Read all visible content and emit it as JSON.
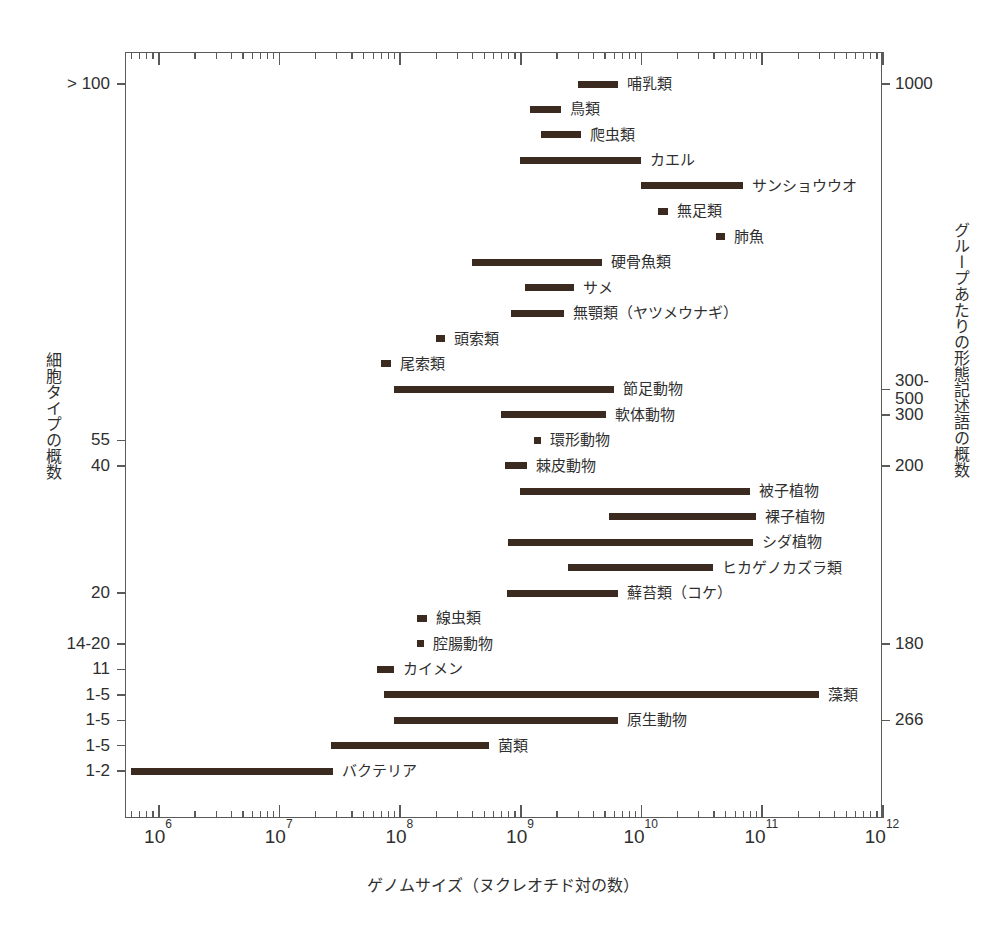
{
  "chart_data": {
    "type": "bar",
    "orientation": "horizontal-range",
    "title": "",
    "xlabel": "ゲノムサイズ（ヌクレオチド対の数）",
    "ylabel_left": "細胞タイプの概数",
    "ylabel_right": "グループあたりの形態記述語の概数",
    "xscale": "log",
    "xlim": [
      1000000,
      1000000000000
    ],
    "xticks": [
      "10⁶",
      "10⁷",
      "10⁸",
      "10⁹",
      "10¹⁰",
      "10¹¹",
      "10¹²"
    ],
    "xtick_exponents": [
      6,
      7,
      8,
      9,
      10,
      11,
      12
    ],
    "grid": false,
    "legend": "none",
    "bars": [
      {
        "label": "哺乳類",
        "x_start": 3000000000.0,
        "x_end": 6500000000.0,
        "row": 0
      },
      {
        "label": "鳥類",
        "x_start": 1200000000.0,
        "x_end": 2200000000.0,
        "row": 1
      },
      {
        "label": "爬虫類",
        "x_start": 1500000000.0,
        "x_end": 3200000000.0,
        "row": 2
      },
      {
        "label": "カエル",
        "x_start": 1000000000.0,
        "x_end": 10000000000.0,
        "row": 3
      },
      {
        "label": "サンショウウオ",
        "x_start": 10000000000.0,
        "x_end": 70000000000.0,
        "row": 4
      },
      {
        "label": "無足類",
        "x_start": 14000000000.0,
        "x_end": 17000000000.0,
        "row": 5
      },
      {
        "label": "肺魚",
        "x_start": 42000000000.0,
        "x_end": 50000000000.0,
        "row": 6
      },
      {
        "label": "硬骨魚類",
        "x_start": 400000000.0,
        "x_end": 4800000000.0,
        "row": 7
      },
      {
        "label": "サメ",
        "x_start": 1100000000.0,
        "x_end": 2800000000.0,
        "row": 8
      },
      {
        "label": "無顎類（ヤツメウナギ）",
        "x_start": 850000000.0,
        "x_end": 2300000000.0,
        "row": 9
      },
      {
        "label": "頭索類",
        "x_start": 200000000.0,
        "x_end": 240000000.0,
        "row": 10
      },
      {
        "label": "尾索類",
        "x_start": 70000000.0,
        "x_end": 85000000.0,
        "row": 11
      },
      {
        "label": "節足動物",
        "x_start": 90000000.0,
        "x_end": 6000000000.0,
        "row": 12
      },
      {
        "label": "軟体動物",
        "x_start": 700000000.0,
        "x_end": 5200000000.0,
        "row": 13
      },
      {
        "label": "環形動物",
        "x_start": 1300000000.0,
        "x_end": 1500000000.0,
        "row": 14
      },
      {
        "label": "棘皮動物",
        "x_start": 750000000.0,
        "x_end": 1150000000.0,
        "row": 15
      },
      {
        "label": "被子植物",
        "x_start": 1000000000.0,
        "x_end": 80000000000.0,
        "row": 16
      },
      {
        "label": "裸子植物",
        "x_start": 5500000000.0,
        "x_end": 90000000000.0,
        "row": 17
      },
      {
        "label": "シダ植物",
        "x_start": 800000000.0,
        "x_end": 85000000000.0,
        "row": 18
      },
      {
        "label": "ヒカゲノカズラ類",
        "x_start": 2500000000.0,
        "x_end": 40000000000.0,
        "row": 19
      },
      {
        "label": "蘚苔類（コケ）",
        "x_start": 780000000.0,
        "x_end": 6500000000.0,
        "row": 20
      },
      {
        "label": "線虫類",
        "x_start": 140000000.0,
        "x_end": 170000000.0,
        "row": 21
      },
      {
        "label": "腔腸動物",
        "x_start": 140000000.0,
        "x_end": 160000000.0,
        "row": 22
      },
      {
        "label": "カイメン",
        "x_start": 65000000.0,
        "x_end": 90000000.0,
        "row": 23
      },
      {
        "label": "藻類",
        "x_start": 75000000.0,
        "x_end": 300000000000.0,
        "row": 24
      },
      {
        "label": "原生動物",
        "x_start": 90000000.0,
        "x_end": 6500000000.0,
        "row": 25
      },
      {
        "label": "菌類",
        "x_start": 27000000.0,
        "x_end": 550000000.0,
        "row": 26
      },
      {
        "label": "バクテリア",
        "x_start": 600000.0,
        "x_end": 28000000.0,
        "row": 27
      }
    ],
    "ytick_labels_left": [
      {
        "text": "> 100",
        "row": 0
      },
      {
        "text": "55",
        "row": 14
      },
      {
        "text": "40",
        "row": 15
      },
      {
        "text": "20",
        "row": 20
      },
      {
        "text": "14-20",
        "row": 22
      },
      {
        "text": "11",
        "row": 23
      },
      {
        "text": "1-5",
        "row": 24
      },
      {
        "text": "1-5",
        "row": 25
      },
      {
        "text": "1-5",
        "row": 26
      },
      {
        "text": "1-2",
        "row": 27
      }
    ],
    "ytick_labels_right": [
      {
        "text": "1000",
        "row": 0
      },
      {
        "text": "300-\n500",
        "row": 12
      },
      {
        "text": "300",
        "row": 13
      },
      {
        "text": "200",
        "row": 15
      },
      {
        "text": "180",
        "row": 22
      },
      {
        "text": "266",
        "row": 25
      }
    ],
    "bar_color": "#3b2a20",
    "axis_color": "#5a5a58",
    "text_color": "#2f2f2f",
    "background": "#ffffff"
  }
}
